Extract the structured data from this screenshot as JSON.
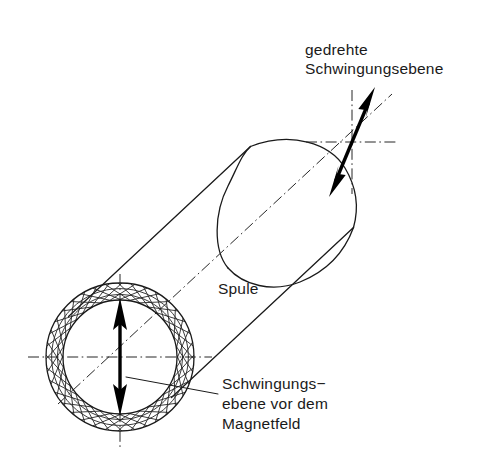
{
  "figure": {
    "kind": "technical-line-drawing",
    "background_color": "#ffffff",
    "line_color": "#1a1a1a",
    "arrow_color": "#000000",
    "width": 504,
    "height": 475
  },
  "labels": {
    "rotated_plane": {
      "line1": "gedrehte",
      "line2": "Schwingungsebene",
      "x": 305,
      "y": 55
    },
    "coil": {
      "line1": "Spule",
      "x": 218,
      "y": 294
    },
    "incident_plane": {
      "line1": "Schwingungs−",
      "line2": "ebene vor dem",
      "line3": "Magnetfeld",
      "x": 222,
      "y": 389
    }
  },
  "geometry": {
    "coil_face": {
      "center_x": 120,
      "center_y": 357,
      "outer_radius": 74,
      "inner_radius": 57,
      "hatch_rings": 3,
      "hatch_spokes": 36
    },
    "cylinder": {
      "axis_start_x": 120,
      "axis_start_y": 357,
      "axis_end_x": 372,
      "axis_end_y": 122,
      "far_cap_center_x": 302,
      "far_cap_center_y": 228,
      "far_cap_rx": 74,
      "far_cap_ry": 47
    },
    "polarization_arrow_before": {
      "x": 120,
      "y_top": 300,
      "y_bottom": 414,
      "angle_deg": 90
    },
    "polarization_arrow_after": {
      "center_x": 352,
      "center_y": 142,
      "length": 104,
      "angle_deg": 67
    },
    "crosshair_after": {
      "center_x": 352,
      "center_y": 142,
      "half_width": 46,
      "half_height": 52
    }
  },
  "line_styles": {
    "centerline": "dash-dot",
    "outline": "solid",
    "hatching": "cross-hatch-lattice"
  }
}
